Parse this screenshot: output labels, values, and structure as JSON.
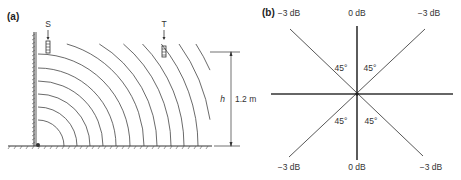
{
  "panel_a": {
    "label": "(a)",
    "source_label": "S",
    "target_label": "T",
    "height_symbol": "h",
    "height_value": "1.2 m",
    "arc_center": [
      38,
      146
    ],
    "arc_radii": [
      26,
      39,
      52,
      65,
      78,
      92,
      106,
      119,
      133,
      146,
      160,
      174,
      188,
      202
    ]
  },
  "panel_b": {
    "label": "(b)",
    "top_left": "−3 dB",
    "top_center": "0 dB",
    "top_right": "−3 dB",
    "bottom_left": "−3 dB",
    "bottom_center": "0 dB",
    "bottom_right": "−3 dB",
    "angle_ul": "45°",
    "angle_ur": "45°",
    "angle_ll": "45°",
    "angle_lr": "45°"
  },
  "colors": {
    "line": "#333333",
    "arc": "#444444"
  }
}
